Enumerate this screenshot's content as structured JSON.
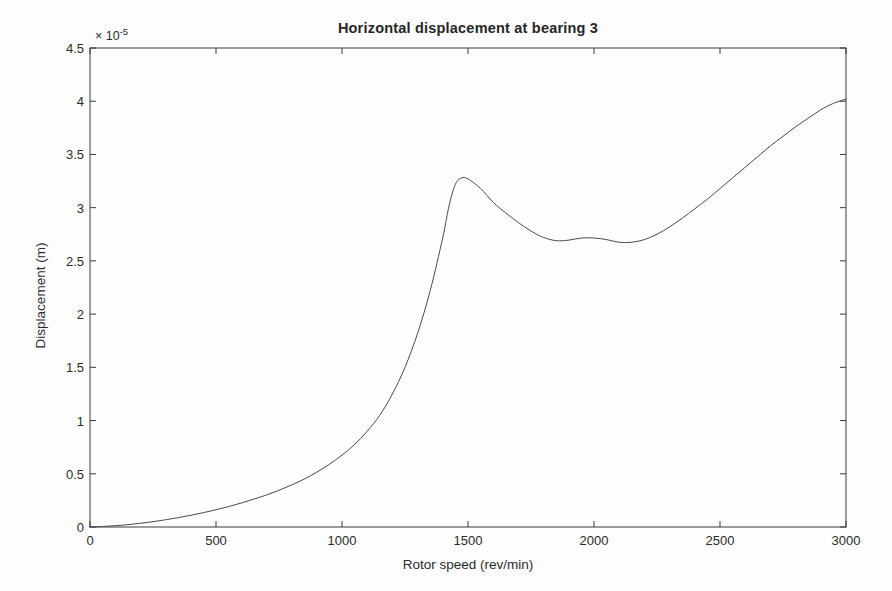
{
  "chart_data": {
    "type": "line",
    "title": "Horizontal displacement at bearing 3",
    "xlabel": "Rotor speed (rev/min)",
    "ylabel": "Displacement (m)",
    "y_exponent_prefix": "× 10",
    "y_exponent_value": "-5",
    "y_scale_factor": 1e-05,
    "xlim": [
      0,
      3000
    ],
    "ylim": [
      0,
      4.5
    ],
    "xticks": [
      0,
      500,
      1000,
      1500,
      2000,
      2500,
      3000
    ],
    "xtick_labels": [
      "0",
      "500",
      "1000",
      "1500",
      "2000",
      "2500",
      "3000"
    ],
    "yticks": [
      0,
      0.5,
      1,
      1.5,
      2,
      2.5,
      3,
      3.5,
      4,
      4.5
    ],
    "ytick_labels": [
      "0",
      "0.5",
      "1",
      "1.5",
      "2",
      "2.5",
      "3",
      "3.5",
      "4",
      "4.5"
    ],
    "grid": false,
    "legend": null,
    "line_color": "#4a4a4a",
    "line_width": 1,
    "series": [
      {
        "name": "Horizontal displacement at bearing 3",
        "x": [
          0,
          50,
          100,
          150,
          200,
          250,
          300,
          350,
          400,
          450,
          500,
          550,
          600,
          650,
          700,
          750,
          800,
          850,
          900,
          950,
          1000,
          1050,
          1100,
          1150,
          1200,
          1250,
          1300,
          1350,
          1400,
          1425,
          1450,
          1475,
          1500,
          1550,
          1600,
          1650,
          1700,
          1750,
          1800,
          1850,
          1900,
          1950,
          2000,
          2050,
          2100,
          2150,
          2200,
          2250,
          2300,
          2350,
          2400,
          2450,
          2500,
          2550,
          2600,
          2650,
          2700,
          2750,
          2800,
          2850,
          2900,
          2950,
          3000
        ],
        "y": [
          0.0,
          0.005,
          0.012,
          0.022,
          0.035,
          0.05,
          0.068,
          0.088,
          0.11,
          0.135,
          0.162,
          0.192,
          0.225,
          0.262,
          0.3,
          0.345,
          0.395,
          0.45,
          0.515,
          0.59,
          0.675,
          0.775,
          0.9,
          1.05,
          1.25,
          1.5,
          1.82,
          2.22,
          2.72,
          3.02,
          3.22,
          3.28,
          3.27,
          3.18,
          3.05,
          2.95,
          2.86,
          2.78,
          2.72,
          2.69,
          2.695,
          2.715,
          2.715,
          2.7,
          2.675,
          2.675,
          2.7,
          2.75,
          2.82,
          2.9,
          2.99,
          3.08,
          3.18,
          3.28,
          3.38,
          3.48,
          3.58,
          3.67,
          3.76,
          3.84,
          3.92,
          3.98,
          4.02
        ]
      }
    ],
    "annotations": [
      {
        "label": "resonance peak",
        "x": 1450,
        "y": 3.28
      },
      {
        "label": "local minimum",
        "x": 1830,
        "y": 2.69
      },
      {
        "label": "local bump",
        "x": 1960,
        "y": 2.72
      },
      {
        "label": "second local minimum",
        "x": 2120,
        "y": 2.67
      },
      {
        "label": "end value",
        "x": 3000,
        "y": 4.02
      }
    ]
  },
  "plot_box": {
    "left": 90,
    "top": 48,
    "right": 846,
    "bottom": 527
  }
}
